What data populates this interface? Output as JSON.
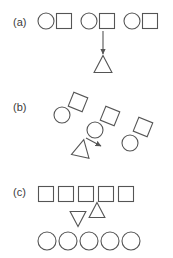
{
  "figure": {
    "width": 173,
    "height": 258,
    "background": "#ffffff",
    "stroke_color": "#555555",
    "label_color": "#3b3b3b"
  },
  "panels": [
    {
      "id": "a",
      "label": "(a)",
      "label_x": 13,
      "label_y": 26,
      "description": "Three horizontal circle-square pairs, with a downward arrow from the middle pair to a triangle below",
      "shapes": [
        {
          "kind": "circle",
          "name": "circle",
          "cx": 46,
          "cy": 21,
          "r": 8,
          "rotation": 0
        },
        {
          "kind": "square",
          "name": "square",
          "cx": 64,
          "cy": 21,
          "size": 15,
          "rotation": 0
        },
        {
          "kind": "circle",
          "name": "circle",
          "cx": 89,
          "cy": 21,
          "r": 8,
          "rotation": 0
        },
        {
          "kind": "square",
          "name": "square",
          "cx": 107,
          "cy": 21,
          "size": 15,
          "rotation": 0
        },
        {
          "kind": "circle",
          "name": "circle",
          "cx": 132,
          "cy": 21,
          "r": 8,
          "rotation": 0
        },
        {
          "kind": "square",
          "name": "square",
          "cx": 150,
          "cy": 21,
          "size": 15,
          "rotation": 0
        },
        {
          "kind": "triangle",
          "name": "triangle-up",
          "cx": 103,
          "cy": 64,
          "size": 17,
          "rotation": 0
        }
      ],
      "arrows": [
        {
          "name": "arrow-down",
          "x1": 103,
          "y1": 31,
          "x2": 103,
          "y2": 54
        }
      ]
    },
    {
      "id": "b",
      "label": "(b)",
      "label_x": 13,
      "label_y": 111,
      "description": "Three rotated circle-square pairs arranged diagonally, with a rotated triangle and a short arrow pointing down-right",
      "shapes": [
        {
          "kind": "square",
          "name": "square",
          "cx": 78,
          "cy": 102,
          "size": 15,
          "rotation": 22
        },
        {
          "kind": "circle",
          "name": "circle",
          "cx": 62,
          "cy": 115,
          "r": 8,
          "rotation": 0
        },
        {
          "kind": "square",
          "name": "square",
          "cx": 110,
          "cy": 116,
          "size": 15,
          "rotation": 22
        },
        {
          "kind": "circle",
          "name": "circle",
          "cx": 95,
          "cy": 130,
          "r": 8,
          "rotation": 0
        },
        {
          "kind": "square",
          "name": "square",
          "cx": 143,
          "cy": 127,
          "size": 15,
          "rotation": 22
        },
        {
          "kind": "circle",
          "name": "circle",
          "cx": 130,
          "cy": 143,
          "r": 8,
          "rotation": 0
        },
        {
          "kind": "triangle",
          "name": "triangle-up",
          "cx": 82,
          "cy": 148,
          "size": 17,
          "rotation": 12
        }
      ],
      "arrows": [
        {
          "name": "arrow-down-right",
          "x1": 86,
          "y1": 138,
          "x2": 101,
          "y2": 146
        }
      ]
    },
    {
      "id": "c",
      "label": "(c)",
      "label_x": 13,
      "label_y": 196,
      "description": "A row of five squares above a row of five circles, with an up triangle and a down triangle between the rows",
      "shapes": [
        {
          "kind": "square",
          "name": "square",
          "cx": 46,
          "cy": 194,
          "size": 15,
          "rotation": 0
        },
        {
          "kind": "square",
          "name": "square",
          "cx": 66,
          "cy": 194,
          "size": 15,
          "rotation": 0
        },
        {
          "kind": "square",
          "name": "square",
          "cx": 86,
          "cy": 194,
          "size": 15,
          "rotation": 0
        },
        {
          "kind": "square",
          "name": "square",
          "cx": 106,
          "cy": 194,
          "size": 15,
          "rotation": 0
        },
        {
          "kind": "square",
          "name": "square",
          "cx": 126,
          "cy": 194,
          "size": 15,
          "rotation": 0
        },
        {
          "kind": "triangle",
          "name": "triangle-up",
          "cx": 97,
          "cy": 210,
          "size": 15,
          "rotation": 0
        },
        {
          "kind": "triangle",
          "name": "triangle-down",
          "cx": 78,
          "cy": 219,
          "size": 15,
          "rotation": 180
        },
        {
          "kind": "circle",
          "name": "circle",
          "cx": 47,
          "cy": 241,
          "r": 9,
          "rotation": 0
        },
        {
          "kind": "circle",
          "name": "circle",
          "cx": 68,
          "cy": 241,
          "r": 9,
          "rotation": 0
        },
        {
          "kind": "circle",
          "name": "circle",
          "cx": 89,
          "cy": 241,
          "r": 9,
          "rotation": 0
        },
        {
          "kind": "circle",
          "name": "circle",
          "cx": 110,
          "cy": 241,
          "r": 9,
          "rotation": 0
        },
        {
          "kind": "circle",
          "name": "circle",
          "cx": 131,
          "cy": 241,
          "r": 9,
          "rotation": 0
        }
      ],
      "arrows": []
    }
  ]
}
